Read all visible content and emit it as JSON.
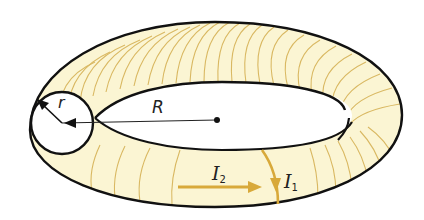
{
  "diagram": {
    "type": "toroid",
    "colors": {
      "background": "#ffffff",
      "torus_fill": "#fbf5d3",
      "winding": "#d9b862",
      "current_arrow": "#d8a93a",
      "outline": "#111111"
    },
    "labels": {
      "major_radius": "R",
      "minor_radius": "r",
      "current_toroidal": {
        "symbol": "I",
        "subscript": "2"
      },
      "current_poloidal": {
        "symbol": "I",
        "subscript": "1"
      }
    }
  }
}
